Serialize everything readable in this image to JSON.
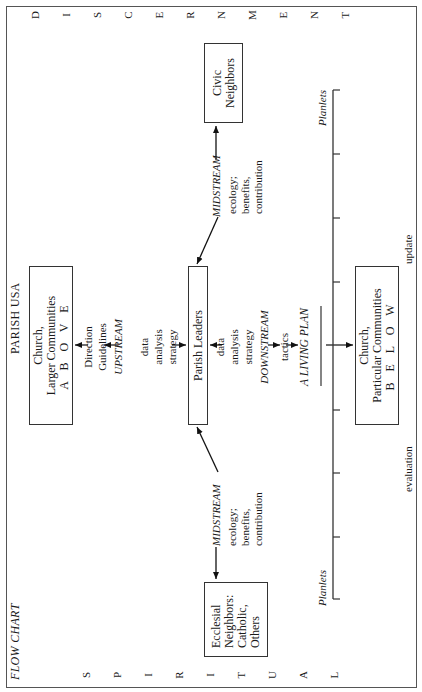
{
  "page": {
    "title": "PARISH USA",
    "subtitle": "FLOW CHART"
  },
  "side_letters": {
    "left": [
      "S",
      "P",
      "I",
      "R",
      "I",
      "T",
      "U",
      "A",
      "L"
    ],
    "right": [
      "D",
      "I",
      "S",
      "C",
      "E",
      "R",
      "N",
      "M",
      "E",
      "N",
      "T"
    ]
  },
  "boxes": {
    "above": {
      "line1": "Church,",
      "line2": "Larger Communities",
      "line3": "A B O V E"
    },
    "parish_leaders": {
      "label": "Parish Leaders"
    },
    "below": {
      "line1": "Church,",
      "line2": "Particular Communities",
      "line3": "B E L O W"
    },
    "civic": {
      "line1": "Civic",
      "line2": "Neighbors"
    },
    "ecclesial": {
      "line1": "Ecclesial",
      "line2": "Neighbors:",
      "line3": "Catholic,",
      "line4": "Others"
    }
  },
  "flows": {
    "upstream": {
      "direction1": "Direction",
      "direction2": "Guidelines",
      "name": "UPSTREAM",
      "data1": "data",
      "data2": "analysis",
      "data3": "strategy"
    },
    "downstream": {
      "data1": "data",
      "data2": "analysis",
      "data3": "strategy",
      "name": "DOWNSTREAM",
      "tactics": "tactics",
      "plan": "A LIVING PLAN"
    },
    "midstream_left": {
      "name": "MIDSTREAM",
      "l1": "ecology;",
      "l2": "benefits,",
      "l3": "contribution"
    },
    "midstream_right": {
      "name": "MIDSTREAM",
      "l1": "ecology;",
      "l2": "benefits,",
      "l3": "contribution"
    }
  },
  "timeline": {
    "start_label": "Planlets",
    "end_label": "Planlets",
    "below_left": "evaluation",
    "below_right": "update",
    "tick_count": 9
  }
}
